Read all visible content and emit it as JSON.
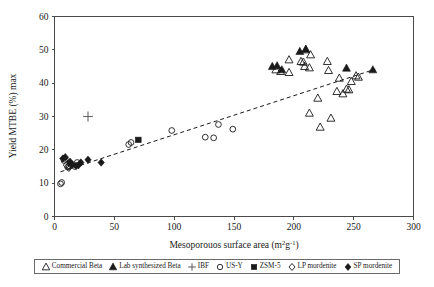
{
  "chart_data": {
    "type": "scatter",
    "title": "",
    "xlabel": "Mesoporouos surface area (m²g⁻¹)",
    "xlabel_base": "Mesoporouos surface area (m",
    "xlabel_sup1": "2",
    "xlabel_mid": "g",
    "xlabel_sup2": "-1",
    "xlabel_tail": ")",
    "ylabel": "Yield MTBE (%) max",
    "xlim": [
      0,
      300
    ],
    "ylim": [
      0,
      60
    ],
    "xticks": [
      0,
      50,
      100,
      150,
      200,
      250,
      300
    ],
    "yticks": [
      0,
      10,
      20,
      30,
      40,
      50,
      60
    ],
    "grid": false,
    "legend_position": "below-axes",
    "trendline": {
      "label": "linear trend (dashed)",
      "x1": 5,
      "y1": 13.4,
      "x2": 268,
      "y2": 44.2
    },
    "series": [
      {
        "name": "Commercial Beta",
        "marker": "open-triangle",
        "points": [
          [
            185,
            44.0
          ],
          [
            189,
            43.5
          ],
          [
            196,
            43.2
          ],
          [
            196,
            47.0
          ],
          [
            206,
            46.5
          ],
          [
            208,
            46.3
          ],
          [
            209,
            45.0
          ],
          [
            210,
            50.0
          ],
          [
            213,
            44.6
          ],
          [
            213,
            31.0
          ],
          [
            214,
            48.5
          ],
          [
            220,
            35.5
          ],
          [
            222,
            26.8
          ],
          [
            228,
            46.5
          ],
          [
            229,
            43.8
          ],
          [
            231,
            29.5
          ],
          [
            236,
            37.5
          ],
          [
            238,
            41.5
          ],
          [
            241,
            36.8
          ],
          [
            244,
            38.2
          ],
          [
            246,
            38.0
          ],
          [
            248,
            40.5
          ],
          [
            252,
            42.2
          ],
          [
            254,
            41.8
          ]
        ]
      },
      {
        "name": "Lab synthesized Beta",
        "marker": "filled-triangle",
        "points": [
          [
            182,
            45.0
          ],
          [
            186,
            45.2
          ],
          [
            190,
            44.0
          ],
          [
            205,
            49.5
          ],
          [
            210,
            50.2
          ],
          [
            244,
            44.5
          ],
          [
            266,
            44.0
          ]
        ]
      },
      {
        "name": "IBF",
        "marker": "plus",
        "points": [
          [
            28,
            30.0
          ]
        ]
      },
      {
        "name": "US-Y",
        "marker": "open-circle",
        "points": [
          [
            5,
            9.8
          ],
          [
            6,
            10.2
          ],
          [
            8,
            16.8
          ],
          [
            9,
            17.2
          ],
          [
            11,
            14.8
          ],
          [
            12,
            15.2
          ],
          [
            13,
            16.0
          ],
          [
            14,
            15.5
          ],
          [
            17,
            15.0
          ],
          [
            19,
            16.2
          ],
          [
            62,
            21.6
          ],
          [
            64,
            22.2
          ],
          [
            98,
            25.8
          ],
          [
            126,
            23.8
          ],
          [
            133,
            23.6
          ],
          [
            137,
            27.6
          ],
          [
            149,
            26.2
          ]
        ]
      },
      {
        "name": "ZSM-5",
        "marker": "filled-square",
        "points": [
          [
            70,
            23.0
          ]
        ]
      },
      {
        "name": "LP mordenite",
        "marker": "open-diamond",
        "points": [
          [
            10,
            15.4
          ],
          [
            12,
            14.6
          ]
        ]
      },
      {
        "name": "SP mordenite",
        "marker": "filled-diamond",
        "points": [
          [
            7,
            17.4
          ],
          [
            9,
            17.8
          ],
          [
            13,
            16.4
          ],
          [
            15,
            15.6
          ],
          [
            18,
            15.2
          ],
          [
            20,
            15.4
          ],
          [
            22,
            16.2
          ],
          [
            28,
            17.0
          ],
          [
            39,
            16.2
          ]
        ]
      }
    ]
  },
  "legend": {
    "items": [
      {
        "label": "Commercial Beta",
        "marker": "open-triangle"
      },
      {
        "label": "Lab synthesized Beta",
        "marker": "filled-triangle"
      },
      {
        "label": "IBF",
        "marker": "plus"
      },
      {
        "label": "US-Y",
        "marker": "open-circle"
      },
      {
        "label": "ZSM-5",
        "marker": "filled-square"
      },
      {
        "label": "LP mordenite",
        "marker": "open-diamond"
      },
      {
        "label": "SP mordenite",
        "marker": "filled-diamond"
      }
    ]
  },
  "colors": {
    "axis": "#4a4a4a",
    "marker": "#1a1a1a",
    "plus": "#666666",
    "background": "#ffffff"
  }
}
